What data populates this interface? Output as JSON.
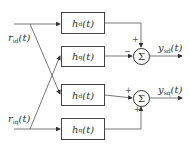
{
  "diagram": {
    "inputs": [
      {
        "label": "r",
        "sub": "id",
        "arg": "(t)"
      },
      {
        "label": "r",
        "sub": "iq",
        "arg": "(t)"
      }
    ],
    "blocks": [
      {
        "label": "h",
        "sub": "d",
        "arg": "(t)"
      },
      {
        "label": "h",
        "sub": "q",
        "arg": "(t)"
      },
      {
        "label": "h",
        "sub": "d",
        "arg": "(t)"
      },
      {
        "label": "h",
        "sub": "q",
        "arg": "(t)"
      }
    ],
    "summers": [
      {
        "symbol": "Σ",
        "sign_top": "+",
        "sign_left": "−"
      },
      {
        "symbol": "Σ",
        "sign_left": "+",
        "sign_bottom": "+"
      }
    ],
    "outputs": [
      {
        "label": "y",
        "sub": "sd",
        "arg": "(t)"
      },
      {
        "label": "y",
        "sub": "sq",
        "arg": "(t)"
      }
    ],
    "colors": {
      "line": "#555555",
      "text": "#333333"
    }
  }
}
